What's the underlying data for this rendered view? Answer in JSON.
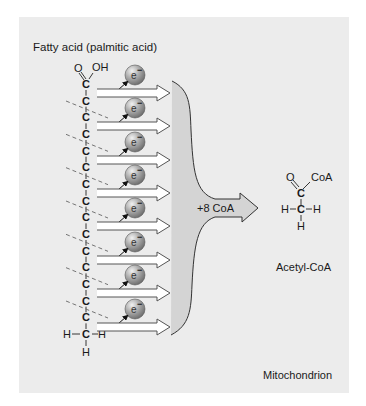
{
  "diagram": {
    "title": "Fatty acid (palmitic acid)",
    "reagent_label": "+8 CoA",
    "product_label": "Acetyl-CoA",
    "compartment_label": "Mitochondrion",
    "colors": {
      "background": "#ffffff",
      "panel": "#ececec",
      "text": "#1a1a1a",
      "arrow_fill": "#ffffff",
      "arrow_stroke": "#555555",
      "big_arrow_fill": "#d4d4d4",
      "electron_sphere": "#9a9a9a",
      "electron_highlight": "#e6e6e6",
      "dash_line": "#666666"
    },
    "fatty_acid": {
      "carboxyl_O": "O",
      "carboxyl_OH": "OH",
      "carbon_symbol": "C",
      "carbon_count": 16,
      "terminal_H_left": "H",
      "terminal_H_right": "H",
      "terminal_H_bottom": "H"
    },
    "electron": {
      "symbol": "e",
      "charge": "−",
      "count": 8
    },
    "cleavage_sites": 7,
    "acetyl_coa": {
      "O": "O",
      "CoA": "CoA",
      "C_carbonyl": "C",
      "C_methyl": "C",
      "H_left": "H",
      "H_right": "H",
      "H_bottom": "H"
    }
  }
}
